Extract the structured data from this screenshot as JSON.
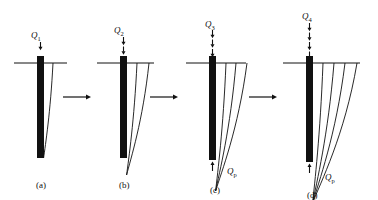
{
  "figure": {
    "background_color": "#ffffff",
    "ink_color": "#111111",
    "pile_color": "#111111",
    "width": 378,
    "height": 200
  },
  "panels": [
    {
      "id": "a",
      "caption": "(a)",
      "caption_x": 36,
      "caption_y": 181,
      "load_label": "Q",
      "load_sub": "1",
      "load_label_x": 31,
      "load_label_y": 31,
      "tip_label": null,
      "tip_sub": null,
      "pile": {
        "x": 37,
        "top": 56,
        "bottom": 158,
        "width": 7
      },
      "ground_line": {
        "x1": 14,
        "x2": 67,
        "y": 63
      },
      "top_arrows": 1,
      "top_arrow_y_start": 42,
      "curves": 1,
      "curve_spread": [
        9
      ],
      "curve_depth": [
        95
      ],
      "has_tip_arrow": false
    },
    {
      "id": "b",
      "caption": "(b)",
      "caption_x": 119,
      "caption_y": 181,
      "load_label": "Q",
      "load_sub": "2",
      "load_label_x": 114,
      "load_label_y": 26,
      "tip_label": null,
      "tip_sub": null,
      "pile": {
        "x": 120,
        "top": 56,
        "bottom": 158,
        "width": 7
      },
      "ground_line": {
        "x1": 97,
        "x2": 154,
        "y": 63
      },
      "top_arrows": 2,
      "top_arrow_y_start": 37,
      "curves": 2,
      "curve_spread": [
        10,
        22
      ],
      "curve_depth": [
        112,
        112
      ],
      "has_tip_arrow": false
    },
    {
      "id": "c",
      "caption": "(c)",
      "caption_x": 210,
      "caption_y": 186,
      "load_label": "Q",
      "load_sub": "3",
      "load_label_x": 205,
      "load_label_y": 20,
      "tip_label": "Q",
      "tip_sub": "p",
      "tip_label_x": 227,
      "tip_label_y": 167,
      "pile": {
        "x": 209,
        "top": 56,
        "bottom": 160,
        "width": 7
      },
      "ground_line": {
        "x1": 186,
        "x2": 246,
        "y": 63
      },
      "top_arrows": 3,
      "top_arrow_y_start": 30,
      "curves": 3,
      "curve_spread": [
        10,
        20,
        31
      ],
      "curve_depth": [
        128,
        128,
        128
      ],
      "has_tip_arrow": true
    },
    {
      "id": "d",
      "caption": "(d)",
      "caption_x": 307,
      "caption_y": 191,
      "load_label": "Q",
      "load_sub": "4",
      "load_label_x": 302,
      "load_label_y": 12,
      "tip_label": "Q",
      "tip_sub": "p",
      "tip_label_x": 325,
      "tip_label_y": 173,
      "pile": {
        "x": 306,
        "top": 56,
        "bottom": 162,
        "width": 7
      },
      "ground_line": {
        "x1": 283,
        "x2": 360,
        "y": 63
      },
      "top_arrows": 4,
      "top_arrow_y_start": 23,
      "curves": 4,
      "curve_spread": [
        10,
        21,
        32,
        44
      ],
      "curve_depth": [
        140,
        140,
        140,
        140
      ],
      "has_tip_arrow": true
    }
  ],
  "connectors": [
    {
      "id": "arrow-a-to-b",
      "x1": 63,
      "x2": 91,
      "y": 97
    },
    {
      "id": "arrow-b-to-c",
      "x1": 150,
      "x2": 178,
      "y": 97
    },
    {
      "id": "arrow-c-to-d",
      "x1": 249,
      "x2": 277,
      "y": 97
    }
  ]
}
